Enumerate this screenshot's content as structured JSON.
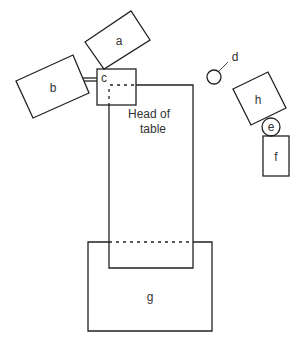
{
  "diagram": {
    "labels": {
      "a": "a",
      "b": "b",
      "c": "c",
      "d": "d",
      "e": "e",
      "f": "f",
      "g": "g",
      "h": "h",
      "head_line1": "Head of",
      "head_line2": "table"
    },
    "colors": {
      "stroke": "#222222",
      "text": "#333333",
      "background": "#ffffff"
    }
  }
}
